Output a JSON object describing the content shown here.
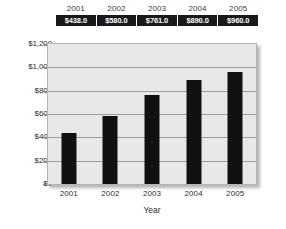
{
  "chart_data": {
    "type": "bar",
    "title": "",
    "subtitle": "",
    "xlabel": "Year",
    "ylabel": "",
    "categories": [
      "2001",
      "2002",
      "2003",
      "2004",
      "2005"
    ],
    "values": [
      438.0,
      580.0,
      761.0,
      890.0,
      960.0
    ],
    "value_labels": [
      "$438.0",
      "$580.0",
      "$761.0",
      "$890.0",
      "$960.0"
    ],
    "series": [
      {
        "name": "",
        "values": [
          438.0,
          580.0,
          761.0,
          890.0,
          960.0
        ]
      }
    ],
    "ylim": [
      0,
      1200
    ],
    "ytick_values": [
      1200,
      1000,
      800,
      600,
      400,
      200,
      0
    ],
    "ytick_labels": [
      "$1,200",
      "$1,000",
      "$800",
      "$600",
      "$400",
      "$200",
      "$0"
    ],
    "xtick_labels": [
      "2001",
      "2002",
      "2003",
      "2004",
      "2005"
    ],
    "grid": "horizontal",
    "legend": "none",
    "bar_color": "#111111",
    "plot_background": "#e8e8e8",
    "gridline_color": "#9d9d9d",
    "data_table": {
      "header_row": [
        "2001",
        "2002",
        "2003",
        "2004",
        "2005"
      ],
      "value_row": [
        "$438.0",
        "$580.0",
        "$761.0",
        "$890.0",
        "$960.0"
      ],
      "header_text_color": "#3d3d3d",
      "value_background": "#191919",
      "value_text_color": "#ffffff"
    }
  }
}
